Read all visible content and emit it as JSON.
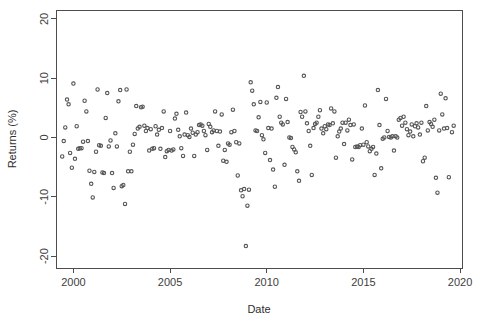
{
  "chart_data": {
    "type": "scatter",
    "title": "",
    "xlabel": "Date",
    "ylabel": "Returns (%)",
    "xlim": [
      1999.1,
      2020.1
    ],
    "ylim": [
      -22,
      21.5
    ],
    "xticks": [
      2000,
      2005,
      2010,
      2015,
      2020
    ],
    "xtick_labels": [
      "2000",
      "2005",
      "2010",
      "2015",
      "2020"
    ],
    "yticks": [
      20,
      10,
      0,
      -10,
      -20
    ],
    "ytick_labels": [
      "20",
      "10",
      "0",
      "-10",
      "-20"
    ],
    "grid": false,
    "legend": null,
    "marker": "open-circle",
    "marker_color": "#555555",
    "series": [
      {
        "name": "Monthly Returns",
        "x": [
          1999.42,
          1999.5,
          1999.58,
          1999.67,
          1999.75,
          1999.83,
          1999.92,
          2000.0,
          2000.08,
          2000.17,
          2000.25,
          2000.33,
          2000.42,
          2000.5,
          2000.58,
          2000.67,
          2000.75,
          2000.83,
          2000.92,
          2001.0,
          2001.08,
          2001.17,
          2001.25,
          2001.33,
          2001.42,
          2001.5,
          2001.58,
          2001.67,
          2001.75,
          2001.83,
          2001.92,
          2002.0,
          2002.08,
          2002.17,
          2002.25,
          2002.33,
          2002.42,
          2002.5,
          2002.58,
          2002.67,
          2002.75,
          2002.83,
          2002.92,
          2003.0,
          2003.08,
          2003.17,
          2003.25,
          2003.33,
          2003.42,
          2003.5,
          2003.58,
          2003.67,
          2003.75,
          2003.83,
          2003.92,
          2004.0,
          2004.08,
          2004.17,
          2004.25,
          2004.33,
          2004.42,
          2004.5,
          2004.58,
          2004.67,
          2004.75,
          2004.83,
          2004.92,
          2005.0,
          2005.08,
          2005.17,
          2005.25,
          2005.33,
          2005.42,
          2005.5,
          2005.58,
          2005.67,
          2005.75,
          2005.83,
          2005.92,
          2006.0,
          2006.08,
          2006.17,
          2006.25,
          2006.33,
          2006.42,
          2006.5,
          2006.58,
          2006.67,
          2006.75,
          2006.83,
          2006.92,
          2007.0,
          2007.08,
          2007.17,
          2007.25,
          2007.33,
          2007.42,
          2007.5,
          2007.58,
          2007.67,
          2007.75,
          2007.83,
          2007.92,
          2008.0,
          2008.08,
          2008.17,
          2008.25,
          2008.33,
          2008.42,
          2008.5,
          2008.58,
          2008.67,
          2008.75,
          2008.83,
          2008.92,
          2009.0,
          2009.08,
          2009.17,
          2009.25,
          2009.33,
          2009.42,
          2009.5,
          2009.58,
          2009.67,
          2009.75,
          2009.83,
          2009.92,
          2010.0,
          2010.08,
          2010.17,
          2010.25,
          2010.33,
          2010.42,
          2010.5,
          2010.58,
          2010.67,
          2010.75,
          2010.83,
          2010.92,
          2011.0,
          2011.08,
          2011.17,
          2011.25,
          2011.33,
          2011.42,
          2011.5,
          2011.58,
          2011.67,
          2011.75,
          2011.83,
          2011.92,
          2012.0,
          2012.08,
          2012.17,
          2012.25,
          2012.33,
          2012.42,
          2012.5,
          2012.58,
          2012.67,
          2012.75,
          2012.83,
          2012.92,
          2013.0,
          2013.08,
          2013.17,
          2013.25,
          2013.33,
          2013.42,
          2013.5,
          2013.58,
          2013.67,
          2013.75,
          2013.83,
          2013.92,
          2014.0,
          2014.08,
          2014.17,
          2014.25,
          2014.33,
          2014.42,
          2014.5,
          2014.58,
          2014.67,
          2014.75,
          2014.83,
          2014.92,
          2015.0,
          2015.08,
          2015.17,
          2015.25,
          2015.33,
          2015.42,
          2015.5,
          2015.58,
          2015.67,
          2015.75,
          2015.83,
          2015.92,
          2016.0,
          2016.08,
          2016.17,
          2016.25,
          2016.33,
          2016.42,
          2016.5,
          2016.58,
          2016.67,
          2016.75,
          2016.83,
          2016.92,
          2017.0,
          2017.08,
          2017.17,
          2017.25,
          2017.33,
          2017.42,
          2017.5,
          2017.58,
          2017.67,
          2017.75,
          2017.83,
          2017.92,
          2018.0,
          2018.08,
          2018.17,
          2018.25,
          2018.33,
          2018.42,
          2018.5,
          2018.58,
          2018.67,
          2018.75,
          2018.83,
          2018.92,
          2019.0,
          2019.08,
          2019.17,
          2019.25,
          2019.33,
          2019.42,
          2019.58,
          2019.67
        ],
        "y": [
          -3.2,
          -0.6,
          1.7,
          6.4,
          5.6,
          -2.6,
          -5.1,
          9.1,
          -3.6,
          1.9,
          -1.9,
          -1.8,
          -1.8,
          -0.7,
          6.2,
          4.4,
          -0.6,
          -5.6,
          -7.8,
          -10.1,
          -5.8,
          -2.4,
          8.1,
          -1.3,
          -1.4,
          -5.9,
          -6.0,
          3.3,
          7.5,
          -1.5,
          -0.5,
          -6.0,
          -8.5,
          0.7,
          -1.5,
          6.1,
          8.0,
          -8.2,
          -8.0,
          -11.2,
          8.1,
          -5.7,
          -2.4,
          -5.7,
          -1.2,
          0.6,
          5.3,
          1.5,
          1.8,
          5.1,
          5.2,
          2.0,
          1.1,
          1.6,
          -2.2,
          1.4,
          -1.9,
          -1.8,
          1.9,
          0.5,
          1.3,
          -1.9,
          1.6,
          4.4,
          -3.3,
          -2.3,
          -2.1,
          1.1,
          -2.2,
          -2.0,
          3.2,
          4.0,
          1.3,
          0.2,
          -1.8,
          -3.1,
          0.5,
          4.2,
          0.4,
          0.1,
          1.5,
          0.8,
          -3.1,
          0.5,
          0.9,
          2.1,
          2.2,
          2.0,
          1.1,
          0.4,
          -2.1,
          2.3,
          1.8,
          0.9,
          1.2,
          4.4,
          1.1,
          -1.4,
          1.0,
          3.9,
          -3.9,
          -2.1,
          -4.1,
          -1.0,
          -1.2,
          0.9,
          4.7,
          1.1,
          -0.8,
          -6.4,
          -1.0,
          -8.9,
          -9.9,
          -8.7,
          -18.3,
          -11.5,
          -8.8,
          9.3,
          7.9,
          5.6,
          1.2,
          1.1,
          3.4,
          6.0,
          0.4,
          -0.3,
          -2.6,
          5.9,
          1.6,
          -3.8,
          1.5,
          -5.4,
          -8.3,
          6.7,
          8.5,
          3.5,
          2.5,
          2.2,
          -4.6,
          6.5,
          2.6,
          0.0,
          -0.1,
          -1.6,
          -2.0,
          -2.5,
          -5.7,
          -7.3,
          4.3,
          3.5,
          10.4,
          4.4,
          2.4,
          1.1,
          -1.4,
          -6.3,
          1.6,
          2.3,
          2.5,
          3.5,
          4.6,
          1.5,
          0.7,
          1.9,
          1.4,
          2.2,
          2.1,
          4.9,
          2.4,
          4.4,
          -3.4,
          0.2,
          1.0,
          1.5,
          2.5,
          -1.1,
          2.5,
          1.2,
          3.0,
          2.1,
          -3.7,
          2.2,
          -1.6,
          -1.5,
          -1.6,
          -1.3,
          1.5,
          -1.2,
          5.4,
          -0.8,
          -1.5,
          -2.3,
          -1.9,
          -1.6,
          -6.3,
          -2.7,
          8.0,
          2.1,
          -5.2,
          -0.2,
          0.0,
          6.5,
          1.1,
          0.1,
          0.0,
          0.2,
          -2.2,
          0.2,
          0.0,
          3.0,
          3.3,
          2.0,
          3.5,
          2.5,
          1.4,
          0.4,
          1.0,
          2.2,
          0.2,
          1.9,
          2.4,
          1.7,
          0.5,
          2.5,
          -4.0,
          -3.4,
          5.3,
          1.2,
          2.6,
          2.3,
          1.8,
          3.0,
          -6.8,
          -9.3,
          1.2,
          7.4,
          3.9,
          1.5,
          6.6,
          1.6,
          -6.7,
          0.9,
          2.0
        ]
      }
    ]
  },
  "plot_geometry": {
    "left": 56,
    "right": 462,
    "top": 10,
    "bottom": 268
  }
}
